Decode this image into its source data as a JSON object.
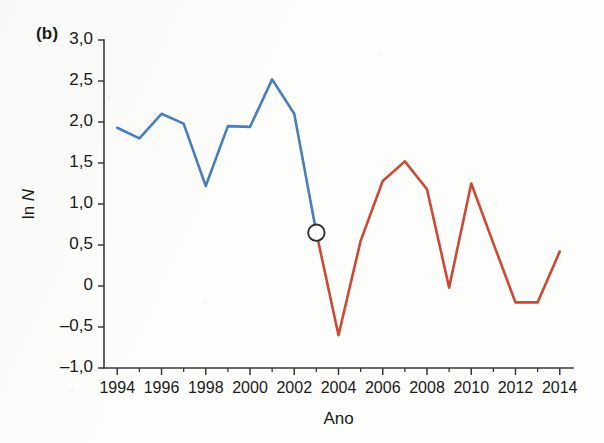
{
  "figure": {
    "panel_label": "(b)",
    "colors": {
      "series_blue": "#4a7ebb",
      "series_red": "#c94a35",
      "axis": "#3a3a3a",
      "marker_fill": "#ffffff",
      "marker_stroke": "#2b2b2b",
      "background": "#fdfdfc"
    }
  },
  "chart_data": {
    "type": "line",
    "title": "",
    "subtitle": "",
    "xlabel": "Ano",
    "ylabel": "ln N",
    "ylabel_plain": "ln N",
    "xlim": [
      1993.4,
      2014.6
    ],
    "ylim": [
      -1.0,
      3.0
    ],
    "grid": false,
    "legend": "none",
    "x_major_ticks": [
      1994,
      1996,
      1998,
      2000,
      2002,
      2004,
      2006,
      2008,
      2010,
      2012,
      2014
    ],
    "x_major_tick_labels": [
      "1994",
      "1996",
      "1998",
      "2000",
      "2002",
      "2004",
      "2006",
      "2008",
      "2010",
      "2012",
      "2014"
    ],
    "x_minor_ticks": [
      1995,
      1997,
      1999,
      2001,
      2003,
      2005,
      2007,
      2009,
      2011,
      2013
    ],
    "y_ticks": [
      -1.0,
      -0.5,
      0,
      0.5,
      1.0,
      1.5,
      2.0,
      2.5,
      3.0
    ],
    "y_tick_labels": [
      "–1,0",
      "–0,5",
      "0",
      "0,5",
      "1,0",
      "1,5",
      "2,0",
      "2,5",
      "3,0"
    ],
    "decimal_separator": ",",
    "series": [
      {
        "name": "serie-azul",
        "color": "#4a7ebb",
        "x": [
          1994,
          1995,
          1996,
          1997,
          1998,
          1999,
          2000,
          2001,
          2002,
          2003
        ],
        "values": [
          1.93,
          1.8,
          2.1,
          1.98,
          1.22,
          1.95,
          1.94,
          2.52,
          2.1,
          0.65
        ]
      },
      {
        "name": "serie-vermelha",
        "color": "#c94a35",
        "x": [
          2003,
          2004,
          2005,
          2006,
          2007,
          2008,
          2009,
          2010,
          2011,
          2012,
          2013,
          2014
        ],
        "values": [
          0.65,
          -0.6,
          0.55,
          1.28,
          1.52,
          1.18,
          -0.02,
          1.25,
          0.52,
          -0.2,
          -0.2,
          0.42
        ]
      }
    ],
    "annotations": [
      {
        "name": "ponto-de-transicao",
        "marker": "open-circle",
        "x": 2003,
        "y": 0.65
      }
    ]
  }
}
